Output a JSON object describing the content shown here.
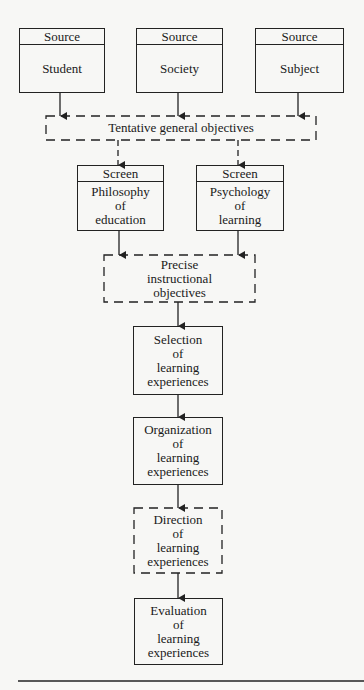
{
  "sources": [
    {
      "header": "Source",
      "label": "Student"
    },
    {
      "header": "Source",
      "label": "Society"
    },
    {
      "header": "Source",
      "label": "Subject"
    }
  ],
  "tentative": {
    "label": "Tentative general objectives"
  },
  "screens": [
    {
      "header": "Screen",
      "lines": [
        "Philosophy",
        "of",
        "education"
      ]
    },
    {
      "header": "Screen",
      "lines": [
        "Psychology",
        "of",
        "learning"
      ]
    }
  ],
  "precise": {
    "lines": [
      "Precise",
      "instructional",
      "objectives"
    ]
  },
  "steps": [
    {
      "lines": [
        "Selection",
        "of",
        "learning",
        "experiences"
      ],
      "style": "solid"
    },
    {
      "lines": [
        "Organization",
        "of",
        "learning",
        "experiences"
      ],
      "style": "solid"
    },
    {
      "lines": [
        "Direction",
        "of",
        "learning",
        "experiences"
      ],
      "style": "dashed"
    },
    {
      "lines": [
        "Evaluation",
        "of",
        "learning",
        "experiences"
      ],
      "style": "solid"
    }
  ],
  "colors": {
    "ink": "#222222",
    "paper": "#f7f7f5"
  }
}
